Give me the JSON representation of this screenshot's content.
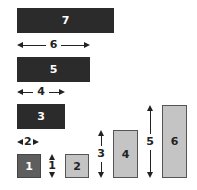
{
  "boxes": [
    {
      "label": "7",
      "shade": "dark"
    },
    {
      "label": "5",
      "shade": "dark"
    },
    {
      "label": "3",
      "shade": "dark"
    },
    {
      "label": "1",
      "shade": "mid"
    },
    {
      "label": "2",
      "shade": "light"
    },
    {
      "label": "4",
      "shade": "light"
    },
    {
      "label": "6",
      "shade": "light"
    }
  ],
  "width_arrows": [
    {
      "label": "6"
    },
    {
      "label": "4"
    },
    {
      "label": "2"
    }
  ],
  "height_arrows": [
    {
      "label": "1"
    },
    {
      "label": "3"
    },
    {
      "label": "5"
    }
  ],
  "colors": {
    "dark": "#2b2b2b",
    "mid": "#5e5e5e",
    "light": "#c4c4c4"
  }
}
